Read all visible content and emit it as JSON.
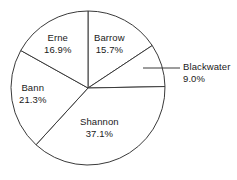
{
  "chart_data": {
    "type": "pie",
    "title": "",
    "subtitle": "",
    "xlabel": "",
    "ylabel": "",
    "legend_position": "none",
    "grid": false,
    "start_angle_deg": 0,
    "direction": "clockwise",
    "units": "percent",
    "categories": [
      "Barrow",
      "Blackwater",
      "Shannon",
      "Bann",
      "Erne"
    ],
    "values": [
      15.7,
      9.0,
      37.1,
      21.3,
      16.9
    ],
    "slices": [
      {
        "name": "Barrow",
        "value": 15.7,
        "value_label": "15.7%",
        "label_placement": "inside",
        "fill": "#ffffff",
        "stroke": "#3a3a3a"
      },
      {
        "name": "Blackwater",
        "value": 9.0,
        "value_label": "9.0%",
        "label_placement": "outside",
        "leader_line": true,
        "fill": "#ffffff",
        "stroke": "#3a3a3a"
      },
      {
        "name": "Shannon",
        "value": 37.1,
        "value_label": "37.1%",
        "label_placement": "inside",
        "fill": "#ffffff",
        "stroke": "#3a3a3a"
      },
      {
        "name": "Bann",
        "value": 21.3,
        "value_label": "21.3%",
        "label_placement": "inside",
        "fill": "#ffffff",
        "stroke": "#3a3a3a"
      },
      {
        "name": "Erne",
        "value": 16.9,
        "value_label": "16.9%",
        "label_placement": "inside",
        "fill": "#ffffff",
        "stroke": "#3a3a3a"
      }
    ]
  },
  "colors": {
    "background": "#ffffff",
    "outline": "#3a3a3a",
    "text": "#1a1a1a"
  }
}
